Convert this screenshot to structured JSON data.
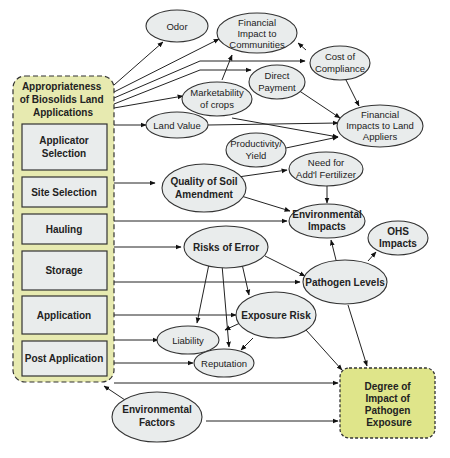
{
  "diagram": {
    "container": {
      "title": [
        "Appropriateness",
        "of Biosolids Land",
        "Applications"
      ],
      "stages": [
        {
          "id": "applicator",
          "lines": [
            "Applicator",
            "Selection"
          ]
        },
        {
          "id": "site",
          "lines": [
            "Site Selection"
          ]
        },
        {
          "id": "hauling",
          "lines": [
            "Hauling"
          ]
        },
        {
          "id": "storage",
          "lines": [
            "Storage"
          ]
        },
        {
          "id": "application",
          "lines": [
            "Application"
          ]
        },
        {
          "id": "post",
          "lines": [
            "Post Application"
          ]
        }
      ]
    },
    "outcome": {
      "lines": [
        "Degree of",
        "Impact of",
        "Pathogen",
        "Exposure"
      ]
    },
    "nodes": [
      {
        "id": "odor",
        "lines": [
          "Odor"
        ],
        "bold": false
      },
      {
        "id": "fin_comm",
        "lines": [
          "Financial",
          "Impact to",
          "Communities"
        ],
        "bold": false
      },
      {
        "id": "cost",
        "lines": [
          "Cost of",
          "Compliance"
        ],
        "bold": false
      },
      {
        "id": "direct",
        "lines": [
          "Direct",
          "Payment"
        ],
        "bold": false
      },
      {
        "id": "market",
        "lines": [
          "Marketability",
          "of crops"
        ],
        "bold": false
      },
      {
        "id": "fin_land",
        "lines": [
          "Financial",
          "Impacts to Land",
          "Appliers"
        ],
        "bold": false
      },
      {
        "id": "landval",
        "lines": [
          "Land Value"
        ],
        "bold": false
      },
      {
        "id": "prod",
        "lines": [
          "Productivity/",
          "Yield"
        ],
        "bold": false
      },
      {
        "id": "quality",
        "lines": [
          "Quality of Soil",
          "Amendment"
        ],
        "bold": true
      },
      {
        "id": "fert",
        "lines": [
          "Need for",
          "Add'l Fertilizer"
        ],
        "bold": false
      },
      {
        "id": "env_imp",
        "lines": [
          "Environmental",
          "Impacts"
        ],
        "bold": true
      },
      {
        "id": "ohs",
        "lines": [
          "OHS",
          "Impacts"
        ],
        "bold": true
      },
      {
        "id": "risks",
        "lines": [
          "Risks of Error"
        ],
        "bold": true
      },
      {
        "id": "pathogen",
        "lines": [
          "Pathogen Levels"
        ],
        "bold": true
      },
      {
        "id": "exposure",
        "lines": [
          "Exposure Risk"
        ],
        "bold": true
      },
      {
        "id": "liability",
        "lines": [
          "Liability"
        ],
        "bold": false
      },
      {
        "id": "reputation",
        "lines": [
          "Reputation"
        ],
        "bold": false
      },
      {
        "id": "env_fac",
        "lines": [
          "Environmental",
          "Factors"
        ],
        "bold": true
      }
    ],
    "colors": {
      "container_fill": "#e7eab0",
      "outcome_fill": "#dfe58a",
      "node_fill": "#e9ecec",
      "stroke": "#333333"
    }
  }
}
